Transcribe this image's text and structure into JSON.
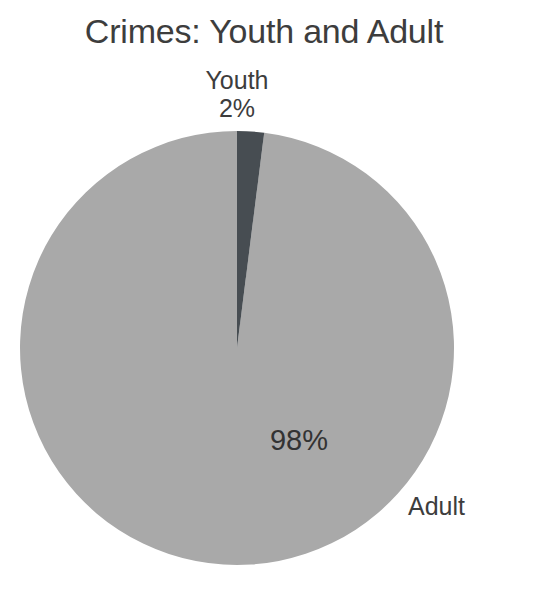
{
  "chart_data": {
    "type": "pie",
    "title": "Crimes: Youth and Adult",
    "categories": [
      "Youth",
      "Adult"
    ],
    "values": [
      2,
      98
    ],
    "value_unit": "%",
    "data_labels": [
      "2%",
      "98%"
    ],
    "legend": "none",
    "grid": false,
    "start_angle_deg": 90,
    "direction": "counterclockwise",
    "colors": [
      "#474d52",
      "#a9a9a9"
    ],
    "background": "#ffffff",
    "slices": [
      {
        "name": "Youth",
        "value": 2,
        "label": "Youth",
        "percent_label": "2%",
        "color": "#474d52",
        "label_position": "outside-top"
      },
      {
        "name": "Adult",
        "value": 98,
        "label": "Adult",
        "percent_label": "98%",
        "color": "#a9a9a9",
        "label_position": "outside-right"
      }
    ]
  },
  "chart": {
    "title": "Crimes: Youth and Adult",
    "youth": {
      "name": "Youth",
      "percent": "2%"
    },
    "adult": {
      "name": "Adult",
      "percent": "98%"
    }
  }
}
